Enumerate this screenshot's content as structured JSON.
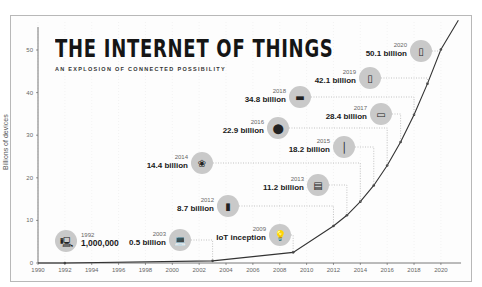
{
  "title": "THE INTERNET OF THINGS",
  "subtitle": "AN EXPLOSION OF CONNECTED POSSIBILITY",
  "ylabel": "Billions of devices",
  "annotations": [
    {
      "year": "1992",
      "value": "1,000,000",
      "icon": "computer-icon"
    },
    {
      "year": "2003",
      "value": "0.5 billion",
      "icon": "laptop-icon"
    },
    {
      "year": "2009",
      "value": "IoT inception",
      "icon": "lightbulb-icon"
    },
    {
      "year": "2012",
      "value": "8.7 billion",
      "icon": "thermostat-icon"
    },
    {
      "year": "2013",
      "value": "11.2 billion",
      "icon": "router-icon"
    },
    {
      "year": "2014",
      "value": "14.4 billion",
      "icon": "wind-turbine-icon"
    },
    {
      "year": "2015",
      "value": "18.2 billion",
      "icon": "streetlight-icon"
    },
    {
      "year": "2016",
      "value": "22.9 billion",
      "icon": "traffic-light-icon"
    },
    {
      "year": "2017",
      "value": "28.4 billion",
      "icon": "tablet-icon"
    },
    {
      "year": "2018",
      "value": "34.8 billion",
      "icon": "tv-icon"
    },
    {
      "year": "2019",
      "value": "42.1 billion",
      "icon": "door-lock-icon"
    },
    {
      "year": "2020",
      "value": "50.1 billion",
      "icon": "refrigerator-icon"
    }
  ],
  "chart_data": {
    "type": "line",
    "title": "THE INTERNET OF THINGS",
    "subtitle": "AN EXPLOSION OF CONNECTED POSSIBILITY",
    "xlabel": "",
    "ylabel": "Billions of devices",
    "x": [
      1992,
      2003,
      2009,
      2012,
      2013,
      2014,
      2015,
      2016,
      2017,
      2018,
      2019,
      2020
    ],
    "series": [
      {
        "name": "Connected devices (billions)",
        "values": [
          0.001,
          0.5,
          2.5,
          8.7,
          11.2,
          14.4,
          18.2,
          22.9,
          28.4,
          34.8,
          42.1,
          50.1
        ]
      }
    ],
    "xticks": [
      "1990",
      "1992",
      "1994",
      "1996",
      "1998",
      "2000",
      "2002",
      "2004",
      "2006",
      "2008",
      "2010",
      "2012",
      "2014",
      "2016",
      "2018",
      "2020"
    ],
    "yticks": [
      "0",
      "10",
      "20",
      "30",
      "40",
      "50"
    ],
    "xlim": [
      1990,
      2021.5
    ],
    "ylim": [
      0,
      52
    ],
    "grid": true,
    "legend": "none"
  }
}
